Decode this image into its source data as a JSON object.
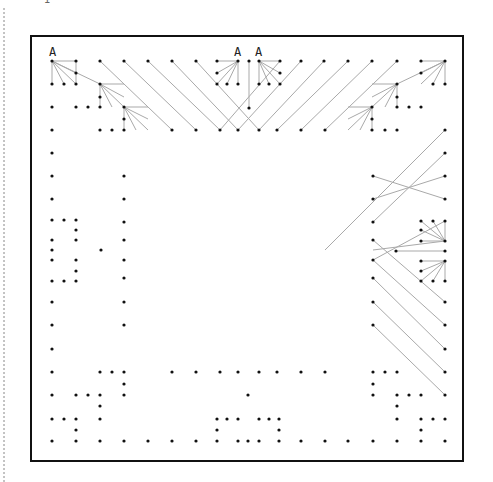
{
  "diagram": {
    "title_fragment": "1",
    "frame": {
      "x": 31,
      "y": 36,
      "w": 432,
      "h": 425
    },
    "labels": [
      {
        "text": "A",
        "x": 49,
        "y": 56
      },
      {
        "text": "A",
        "x": 234,
        "y": 56
      },
      {
        "text": "A",
        "x": 255,
        "y": 56
      }
    ],
    "pins": [
      [
        52,
        61
      ],
      [
        76,
        61
      ],
      [
        100,
        61
      ],
      [
        124,
        61
      ],
      [
        148,
        61
      ],
      [
        172,
        61
      ],
      [
        196,
        61
      ],
      [
        217,
        61
      ],
      [
        238,
        61
      ],
      [
        249,
        61
      ],
      [
        259,
        61
      ],
      [
        280,
        61
      ],
      [
        301,
        61
      ],
      [
        324,
        61
      ],
      [
        348,
        61
      ],
      [
        372,
        61
      ],
      [
        397,
        61
      ],
      [
        421,
        61
      ],
      [
        445,
        61
      ],
      [
        76,
        73
      ],
      [
        217,
        73
      ],
      [
        280,
        73
      ],
      [
        421,
        73
      ],
      [
        52,
        84
      ],
      [
        64,
        84
      ],
      [
        76,
        84
      ],
      [
        100,
        84
      ],
      [
        217,
        84
      ],
      [
        227,
        84
      ],
      [
        238,
        84
      ],
      [
        259,
        84
      ],
      [
        269,
        84
      ],
      [
        280,
        84
      ],
      [
        397,
        84
      ],
      [
        433,
        84
      ],
      [
        445,
        84
      ],
      [
        100,
        97
      ],
      [
        397,
        97
      ],
      [
        52,
        107
      ],
      [
        76,
        107
      ],
      [
        88,
        107
      ],
      [
        100,
        107
      ],
      [
        124,
        107
      ],
      [
        249,
        108
      ],
      [
        372,
        107
      ],
      [
        397,
        107
      ],
      [
        409,
        107
      ],
      [
        421,
        107
      ],
      [
        124,
        119
      ],
      [
        372,
        119
      ],
      [
        52,
        130
      ],
      [
        100,
        130
      ],
      [
        112,
        130
      ],
      [
        124,
        130
      ],
      [
        172,
        130
      ],
      [
        196,
        130
      ],
      [
        220,
        130
      ],
      [
        238,
        130
      ],
      [
        259,
        130
      ],
      [
        277,
        130
      ],
      [
        301,
        130
      ],
      [
        325,
        130
      ],
      [
        372,
        130
      ],
      [
        385,
        130
      ],
      [
        397,
        130
      ],
      [
        445,
        130
      ],
      [
        52,
        153
      ],
      [
        445,
        153
      ],
      [
        52,
        176
      ],
      [
        124,
        176
      ],
      [
        373,
        176
      ],
      [
        445,
        176
      ],
      [
        52,
        199
      ],
      [
        124,
        199
      ],
      [
        373,
        199
      ],
      [
        445,
        199
      ],
      [
        52,
        220
      ],
      [
        64,
        220
      ],
      [
        76,
        220
      ],
      [
        124,
        222
      ],
      [
        373,
        222
      ],
      [
        421,
        221
      ],
      [
        433,
        221
      ],
      [
        445,
        221
      ],
      [
        76,
        230
      ],
      [
        421,
        230
      ],
      [
        52,
        240
      ],
      [
        76,
        240
      ],
      [
        124,
        240
      ],
      [
        373,
        240
      ],
      [
        421,
        241
      ],
      [
        445,
        241
      ],
      [
        52,
        250
      ],
      [
        101,
        250
      ],
      [
        396,
        251
      ],
      [
        445,
        251
      ],
      [
        52,
        260
      ],
      [
        76,
        260
      ],
      [
        124,
        260
      ],
      [
        373,
        260
      ],
      [
        421,
        261
      ],
      [
        445,
        261
      ],
      [
        76,
        271
      ],
      [
        421,
        271
      ],
      [
        52,
        281
      ],
      [
        64,
        281
      ],
      [
        76,
        281
      ],
      [
        124,
        278
      ],
      [
        373,
        278
      ],
      [
        421,
        281
      ],
      [
        433,
        281
      ],
      [
        445,
        281
      ],
      [
        52,
        302
      ],
      [
        124,
        302
      ],
      [
        373,
        302
      ],
      [
        445,
        302
      ],
      [
        52,
        325
      ],
      [
        124,
        325
      ],
      [
        373,
        325
      ],
      [
        445,
        325
      ],
      [
        52,
        349
      ],
      [
        445,
        349
      ],
      [
        52,
        372
      ],
      [
        100,
        372
      ],
      [
        112,
        372
      ],
      [
        124,
        372
      ],
      [
        172,
        372
      ],
      [
        196,
        372
      ],
      [
        220,
        372
      ],
      [
        238,
        372
      ],
      [
        259,
        372
      ],
      [
        277,
        372
      ],
      [
        301,
        372
      ],
      [
        325,
        372
      ],
      [
        373,
        372
      ],
      [
        385,
        372
      ],
      [
        397,
        372
      ],
      [
        445,
        372
      ],
      [
        124,
        384
      ],
      [
        373,
        384
      ],
      [
        52,
        395
      ],
      [
        76,
        395
      ],
      [
        88,
        395
      ],
      [
        100,
        395
      ],
      [
        124,
        395
      ],
      [
        248,
        395
      ],
      [
        373,
        395
      ],
      [
        397,
        395
      ],
      [
        409,
        395
      ],
      [
        421,
        395
      ],
      [
        445,
        395
      ],
      [
        100,
        406
      ],
      [
        397,
        406
      ],
      [
        52,
        419
      ],
      [
        64,
        419
      ],
      [
        76,
        419
      ],
      [
        100,
        419
      ],
      [
        217,
        419
      ],
      [
        227,
        419
      ],
      [
        238,
        419
      ],
      [
        259,
        419
      ],
      [
        269,
        419
      ],
      [
        279,
        419
      ],
      [
        397,
        419
      ],
      [
        421,
        419
      ],
      [
        433,
        419
      ],
      [
        445,
        419
      ],
      [
        76,
        430
      ],
      [
        217,
        430
      ],
      [
        279,
        430
      ],
      [
        421,
        430
      ],
      [
        52,
        441
      ],
      [
        76,
        441
      ],
      [
        100,
        441
      ],
      [
        124,
        441
      ],
      [
        148,
        441
      ],
      [
        172,
        441
      ],
      [
        196,
        441
      ],
      [
        217,
        441
      ],
      [
        238,
        441
      ],
      [
        248,
        441
      ],
      [
        259,
        441
      ],
      [
        279,
        441
      ],
      [
        301,
        441
      ],
      [
        325,
        441
      ],
      [
        348,
        441
      ],
      [
        373,
        441
      ],
      [
        397,
        441
      ],
      [
        421,
        441
      ],
      [
        445,
        441
      ]
    ],
    "wires": [
      [
        52,
        61,
        76,
        61
      ],
      [
        52,
        61,
        76,
        73
      ],
      [
        52,
        61,
        52,
        84
      ],
      [
        52,
        61,
        64,
        84
      ],
      [
        52,
        61,
        76,
        84
      ],
      [
        52,
        61,
        100,
        84
      ],
      [
        100,
        84,
        124,
        84
      ],
      [
        100,
        84,
        124,
        97
      ],
      [
        100,
        84,
        100,
        107
      ],
      [
        100,
        84,
        112,
        107
      ],
      [
        100,
        84,
        124,
        107
      ],
      [
        124,
        107,
        148,
        107
      ],
      [
        124,
        107,
        148,
        119
      ],
      [
        124,
        107,
        124,
        130
      ],
      [
        124,
        107,
        136,
        130
      ],
      [
        124,
        107,
        148,
        130
      ],
      [
        76,
        61,
        76,
        84
      ],
      [
        100,
        61,
        172,
        130
      ],
      [
        124,
        61,
        196,
        130
      ],
      [
        148,
        61,
        220,
        130
      ],
      [
        172,
        61,
        238,
        130
      ],
      [
        196,
        61,
        259,
        130
      ],
      [
        238,
        61,
        217,
        61
      ],
      [
        238,
        61,
        217,
        73
      ],
      [
        238,
        61,
        217,
        84
      ],
      [
        238,
        61,
        227,
        84
      ],
      [
        238,
        61,
        238,
        84
      ],
      [
        249,
        61,
        249,
        108
      ],
      [
        259,
        61,
        280,
        61
      ],
      [
        259,
        61,
        280,
        73
      ],
      [
        259,
        61,
        259,
        84
      ],
      [
        259,
        61,
        269,
        84
      ],
      [
        259,
        61,
        280,
        84
      ],
      [
        280,
        61,
        220,
        130
      ],
      [
        301,
        61,
        238,
        130
      ],
      [
        324,
        61,
        259,
        130
      ],
      [
        348,
        61,
        277,
        130
      ],
      [
        372,
        61,
        301,
        130
      ],
      [
        397,
        61,
        325,
        130
      ],
      [
        445,
        61,
        421,
        61
      ],
      [
        445,
        61,
        421,
        73
      ],
      [
        445,
        61,
        445,
        84
      ],
      [
        445,
        61,
        433,
        84
      ],
      [
        445,
        61,
        421,
        84
      ],
      [
        445,
        61,
        397,
        84
      ],
      [
        397,
        84,
        372,
        84
      ],
      [
        397,
        84,
        372,
        97
      ],
      [
        397,
        84,
        397,
        107
      ],
      [
        397,
        84,
        385,
        107
      ],
      [
        397,
        84,
        372,
        107
      ],
      [
        372,
        107,
        348,
        107
      ],
      [
        372,
        107,
        348,
        119
      ],
      [
        372,
        107,
        372,
        130
      ],
      [
        372,
        107,
        360,
        130
      ],
      [
        372,
        107,
        348,
        130
      ],
      [
        445,
        130,
        325,
        250
      ],
      [
        445,
        153,
        373,
        222
      ],
      [
        445,
        176,
        373,
        199
      ],
      [
        445,
        199,
        373,
        176
      ],
      [
        445,
        221,
        373,
        260
      ],
      [
        445,
        241,
        373,
        250
      ],
      [
        421,
        221,
        445,
        241
      ],
      [
        433,
        221,
        445,
        241
      ],
      [
        421,
        230,
        445,
        241
      ],
      [
        421,
        241,
        445,
        241
      ],
      [
        445,
        221,
        445,
        241
      ],
      [
        396,
        251,
        445,
        251
      ],
      [
        421,
        261,
        445,
        261
      ],
      [
        421,
        271,
        445,
        261
      ],
      [
        421,
        281,
        445,
        261
      ],
      [
        433,
        281,
        445,
        261
      ],
      [
        445,
        281,
        445,
        261
      ],
      [
        373,
        240,
        445,
        302
      ],
      [
        373,
        260,
        445,
        325
      ],
      [
        373,
        278,
        445,
        349
      ],
      [
        373,
        302,
        445,
        372
      ],
      [
        373,
        325,
        445,
        395
      ]
    ]
  }
}
